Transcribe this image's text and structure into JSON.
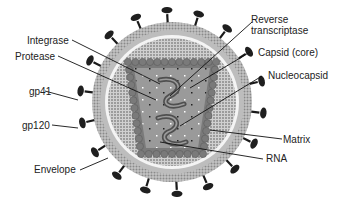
{
  "diagram": {
    "colors": {
      "background": "#ffffff",
      "outer_membrane": "#b8b8b8",
      "membrane_dots": "#8a8a8a",
      "white_ring": "#f2f2f2",
      "matrix_shell": "#a8a8a8",
      "capsid_beads": "#7a7a7a",
      "core_fill": "#9a9a9a",
      "rna_strand": "#5a5a5a",
      "spike_color": "#222222",
      "label_text": "#222222",
      "leader_line": "#111111"
    },
    "labels_left": [
      {
        "id": "integrase",
        "text": "Integrase"
      },
      {
        "id": "protease",
        "text": "Protease"
      },
      {
        "id": "gp41",
        "text": "gp41"
      },
      {
        "id": "gp120",
        "text": "gp120"
      },
      {
        "id": "envelope",
        "text": "Envelope"
      }
    ],
    "labels_right": [
      {
        "id": "reverse_transcriptase_line1",
        "text": "Reverse"
      },
      {
        "id": "reverse_transcriptase_line2",
        "text": "transcriptase"
      },
      {
        "id": "capsid",
        "text": "Capsid (core)"
      },
      {
        "id": "nucleocapsid",
        "text": "Nucleocapsid"
      },
      {
        "id": "matrix",
        "text": "Matrix"
      },
      {
        "id": "rna",
        "text": "RNA"
      }
    ]
  }
}
